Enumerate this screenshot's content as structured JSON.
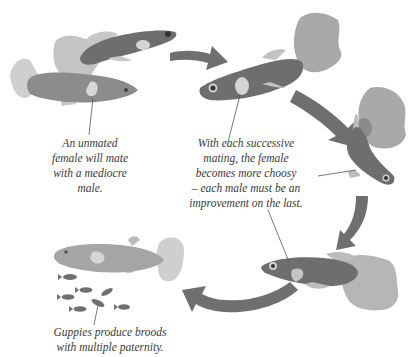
{
  "diagram": {
    "colors": {
      "background": "#ffffff",
      "fish_dark": "#6e6e6e",
      "fish_mid": "#8c8c8c",
      "fish_light": "#bdbdbd",
      "fin_light": "#c4c4c4",
      "spot": "#d4d4d4",
      "arrow": "#6f6f6f",
      "text": "#3a3a3a",
      "leader_line": "#555555"
    },
    "captions": [
      {
        "id": "unmated",
        "lines": [
          "An unmated",
          "female will mate",
          "with a mediocre",
          "male."
        ]
      },
      {
        "id": "choosy",
        "lines": [
          "With each successive",
          "mating, the female",
          "becomes more choosy",
          "– each male must be an",
          "improvement on the last."
        ]
      },
      {
        "id": "broods",
        "lines": [
          "Guppies produce broods",
          "with multiple paternity."
        ]
      }
    ],
    "arrows": [
      {
        "id": "arrow-1",
        "direction": "right"
      },
      {
        "id": "arrow-2",
        "direction": "down-right"
      },
      {
        "id": "arrow-3",
        "direction": "down-left"
      },
      {
        "id": "arrow-4",
        "direction": "left"
      }
    ],
    "fish": [
      {
        "id": "female-top-left",
        "role": "female"
      },
      {
        "id": "male-top-left",
        "role": "male"
      },
      {
        "id": "male-top-center",
        "role": "male"
      },
      {
        "id": "male-right",
        "role": "male"
      },
      {
        "id": "male-bottom-right",
        "role": "male"
      },
      {
        "id": "female-bottom-left",
        "role": "female"
      }
    ],
    "fry_count": 7
  }
}
